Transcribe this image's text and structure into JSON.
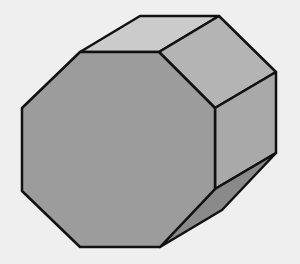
{
  "figure": {
    "background": "#efefef",
    "stroke": "#111111",
    "faces": {
      "front": {
        "fill": "#9c9c9c",
        "points": "80,52 159,52 215,108 215,189 160,247 80,247 22,191 22,108"
      },
      "top": {
        "fill": "#cbcbcb",
        "points": "80,52 140,16 219,16 159,52"
      },
      "top_right": {
        "fill": "#b4b4b4",
        "points": "159,52 219,16 276,72 215,108"
      },
      "right": {
        "fill": "#a9a9a9",
        "points": "215,108 276,72 276,153 215,189"
      },
      "bottom_right": {
        "fill": "#8a8a8a",
        "points": "215,189 276,153 222,210 160,247"
      }
    }
  }
}
